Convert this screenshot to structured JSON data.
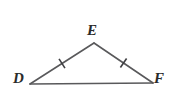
{
  "figure": {
    "background_color": "#ffffff",
    "stroke_color": "#59595b",
    "label_color": "#2b2b2b",
    "stroke_width": 1.6,
    "vertices": [
      {
        "name": "D",
        "label": "D",
        "x": 30,
        "y": 84,
        "label_x": 13,
        "label_y": 71
      },
      {
        "name": "E",
        "label": "E",
        "x": 94,
        "y": 43,
        "label_x": 87,
        "label_y": 23
      },
      {
        "name": "F",
        "label": "F",
        "x": 153,
        "y": 83,
        "label_x": 154,
        "label_y": 71
      }
    ],
    "sides": [
      {
        "name": "DE",
        "from": "D",
        "to": "E",
        "tick_count": 1
      },
      {
        "name": "EF",
        "from": "E",
        "to": "F",
        "tick_count": 1
      },
      {
        "name": "DF",
        "from": "D",
        "to": "F",
        "tick_count": 0
      }
    ],
    "tick_marks": [
      {
        "name": "tick-DE",
        "side": "DE",
        "x": 62,
        "y": 63.5,
        "length": 11,
        "angle_deg": -32.6
      },
      {
        "name": "tick-EF",
        "side": "EF",
        "x": 123.5,
        "y": 63,
        "length": 11,
        "angle_deg": 34.1
      }
    ]
  }
}
